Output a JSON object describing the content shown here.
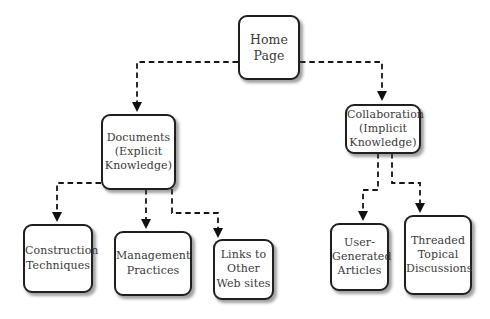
{
  "diagram": {
    "nodes": {
      "home": {
        "label": [
          "Home",
          "Page"
        ]
      },
      "documents": {
        "label": [
          "Documents",
          "(Explicit",
          "Knowledge)"
        ]
      },
      "collaboration": {
        "label": [
          "Collaboration",
          "(Implicit",
          "Knowledge)"
        ]
      },
      "construction": {
        "label": [
          "Construction",
          "Techniques"
        ]
      },
      "management": {
        "label": [
          "Management",
          "Practices"
        ]
      },
      "links": {
        "label": [
          "Links to",
          "Other",
          "Web sites"
        ]
      },
      "usergen": {
        "label": [
          "User-",
          "Generated",
          "Articles"
        ]
      },
      "threaded": {
        "label": [
          "Threaded",
          "Topical",
          "Discussions"
        ]
      }
    },
    "edges": [
      {
        "from": "home",
        "to": "documents"
      },
      {
        "from": "home",
        "to": "collaboration"
      },
      {
        "from": "documents",
        "to": "construction"
      },
      {
        "from": "documents",
        "to": "management"
      },
      {
        "from": "documents",
        "to": "links"
      },
      {
        "from": "collaboration",
        "to": "usergen"
      },
      {
        "from": "collaboration",
        "to": "threaded"
      }
    ],
    "connector_style": "dashed-arrow"
  },
  "colors": {
    "background": "#ffffff",
    "box_fill": "#ffffff",
    "box_border": "#1f1f1f",
    "text": "#3a3a3a",
    "connector": "#161616"
  }
}
